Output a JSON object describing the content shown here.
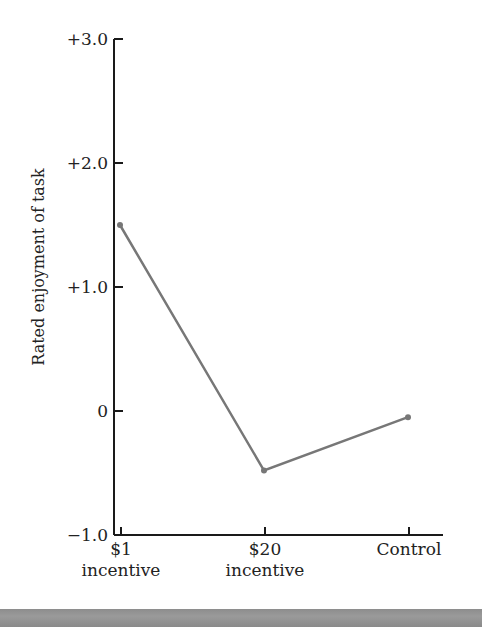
{
  "chart_data": {
    "type": "line",
    "title": "",
    "xlabel": "",
    "ylabel": "Rated enjoyment of task",
    "categories": [
      "$1 incentive",
      "$20 incentive",
      "Control"
    ],
    "category_lines": [
      [
        "$1",
        "incentive"
      ],
      [
        "$20",
        "incentive"
      ],
      [
        "Control"
      ]
    ],
    "series": [
      {
        "name": "Rated enjoyment",
        "values": [
          1.5,
          -0.48,
          -0.05
        ]
      }
    ],
    "ylim": [
      -1.0,
      3.0
    ],
    "yticks": [
      3.0,
      2.0,
      1.0,
      0,
      -1.0
    ],
    "ytick_labels": [
      "+3.0",
      "+2.0",
      "+1.0",
      "0",
      "−1.0"
    ],
    "grid": false,
    "legend": "none",
    "line_color": "#777777",
    "axis_color": "#1a1a1a"
  },
  "layout": {
    "y_axis_x": 114,
    "y_px_per_unit": 124,
    "y_zero_px": 411,
    "x_positions": [
      121,
      265,
      409
    ],
    "x_axis_end": 443
  }
}
